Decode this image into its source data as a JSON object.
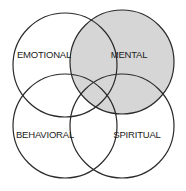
{
  "diagram": {
    "type": "venn",
    "highlight_color": "#d6d6d6",
    "stroke_color": "#2a2a2a",
    "circles": [
      {
        "id": "emotional",
        "label": "EMOTIONAL",
        "cx": 65,
        "cy": 65,
        "r": 52,
        "highlighted": false,
        "label_x": 44,
        "label_y": 55
      },
      {
        "id": "mental",
        "label": "MENTAL",
        "cx": 122,
        "cy": 62,
        "r": 52,
        "highlighted": true,
        "label_x": 129,
        "label_y": 55
      },
      {
        "id": "behavioral",
        "label": "BEHAVIORAL",
        "cx": 65,
        "cy": 126,
        "r": 52,
        "highlighted": false,
        "label_x": 45,
        "label_y": 135
      },
      {
        "id": "spiritual",
        "label": "SPIRITUAL",
        "cx": 122,
        "cy": 126,
        "r": 52,
        "highlighted": false,
        "label_x": 137,
        "label_y": 135
      }
    ]
  }
}
